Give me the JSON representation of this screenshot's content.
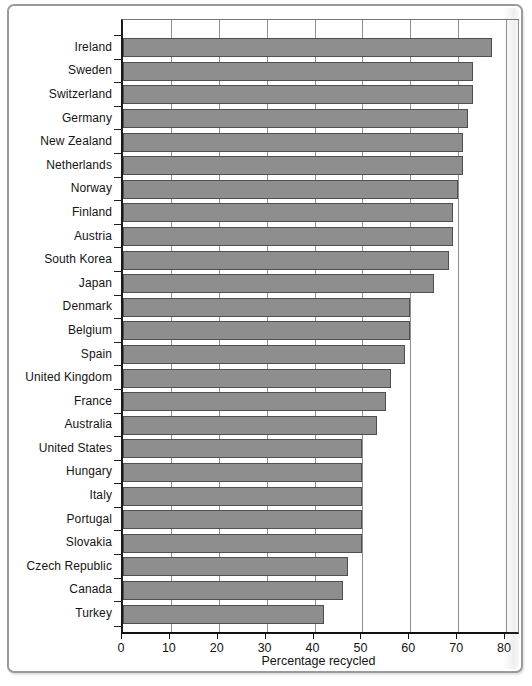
{
  "chart_data": {
    "type": "bar",
    "orientation": "horizontal",
    "title": "",
    "xlabel": "Percentage recycled",
    "ylabel": "",
    "categories": [
      "Ireland",
      "Sweden",
      "Switzerland",
      "Germany",
      "New Zealand",
      "Netherlands",
      "Norway",
      "Finland",
      "Austria",
      "South Korea",
      "Japan",
      "Denmark",
      "Belgium",
      "Spain",
      "United Kingdom",
      "France",
      "Australia",
      "United States",
      "Hungary",
      "Italy",
      "Portugal",
      "Slovakia",
      "Czech Republic",
      "Canada",
      "Turkey"
    ],
    "values": [
      77,
      73,
      73,
      72,
      71,
      71,
      70,
      69,
      69,
      68,
      65,
      60,
      60,
      59,
      56,
      55,
      53,
      50,
      50,
      50,
      50,
      50,
      47,
      46,
      42
    ],
    "x_ticks": [
      0,
      10,
      20,
      30,
      40,
      50,
      60,
      70,
      80
    ],
    "xlim": [
      0,
      82.5
    ],
    "grid": "vertical-gridlines-behind-bars",
    "legend": "none",
    "bar_color": "#8e8e8e",
    "bar_border_color": "#4f4f4f",
    "grid_color": "#8f8f8f",
    "axis_color": "#1a1a1a",
    "text_color": "#141414",
    "frame_border_color": "#9a9a9a",
    "background_color": "#ffffff"
  }
}
